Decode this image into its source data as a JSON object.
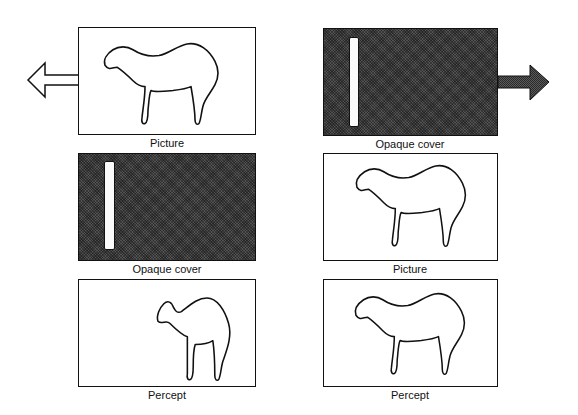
{
  "figure": {
    "left_column": [
      {
        "id": "picture",
        "label": "Picture",
        "type": "picture",
        "arrow": "left"
      },
      {
        "id": "opaque-cover",
        "label": "Opaque cover",
        "type": "cover"
      },
      {
        "id": "percept",
        "label": "Percept",
        "type": "percept-partial"
      }
    ],
    "right_column": [
      {
        "id": "opaque-cover",
        "label": "Opaque cover",
        "type": "cover",
        "arrow": "right"
      },
      {
        "id": "picture",
        "label": "Picture",
        "type": "picture"
      },
      {
        "id": "percept",
        "label": "Percept",
        "type": "percept-full"
      }
    ]
  },
  "colors": {
    "line": "#111111",
    "cover": "#3a3a3a",
    "background": "#ffffff"
  }
}
